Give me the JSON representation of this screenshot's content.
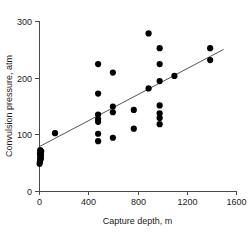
{
  "chart_data": {
    "type": "scatter",
    "title": "",
    "xlabel": "Capture depth, m",
    "ylabel": "Convulsion pressure, atm",
    "xlim": [
      0,
      1600
    ],
    "ylim": [
      0,
      300
    ],
    "xticks": [
      0,
      400,
      800,
      1200,
      1600
    ],
    "yticks": [
      0,
      100,
      200,
      300
    ],
    "xtick_labels": [
      "0",
      "400",
      "800",
      "1200",
      "1600"
    ],
    "ytick_labels": [
      "0",
      "100",
      "200",
      "300"
    ],
    "grid": false,
    "legend": null,
    "marker_color": "#000000",
    "marker_size": 3.1,
    "line_color": "#555555",
    "series": [
      {
        "name": "observations",
        "x": [
          5,
          8,
          10,
          12,
          14,
          10,
          16,
          8,
          12,
          18,
          10,
          14,
          130,
          480,
          480,
          480,
          480,
          480,
          480,
          480,
          600,
          600,
          600,
          600,
          770,
          770,
          890,
          890,
          980,
          980,
          980,
          980,
          980,
          980,
          980,
          1100,
          1390,
          1390
        ],
        "y": [
          48,
          52,
          55,
          58,
          60,
          62,
          64,
          66,
          68,
          70,
          72,
          57,
          102,
          224,
          172,
          135,
          127,
          122,
          101,
          88,
          209,
          149,
          139,
          94,
          143,
          110,
          278,
          181,
          252,
          224,
          194,
          151,
          137,
          129,
          118,
          203,
          252,
          231
        ]
      }
    ],
    "fit_line": {
      "name": "regression-line",
      "x": [
        0,
        1500
      ],
      "y": [
        78,
        250
      ]
    }
  }
}
